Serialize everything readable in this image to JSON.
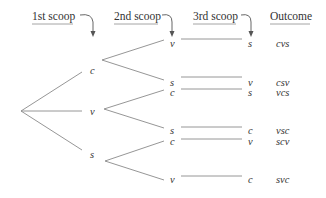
{
  "headers": {
    "first": "1st scoop",
    "second": "2nd scoop",
    "third": "3rd scoop",
    "outcome": "Outcome"
  },
  "level1": [
    {
      "label": "c"
    },
    {
      "label": "v"
    },
    {
      "label": "s"
    }
  ],
  "level2": [
    {
      "label": "v"
    },
    {
      "label": "s"
    },
    {
      "label": "c"
    },
    {
      "label": "s"
    },
    {
      "label": "c"
    },
    {
      "label": "v"
    }
  ],
  "level3": [
    {
      "label": "s"
    },
    {
      "label": "v"
    },
    {
      "label": "s"
    },
    {
      "label": "c"
    },
    {
      "label": "v"
    },
    {
      "label": "c"
    }
  ],
  "outcomes": [
    "cvs",
    "csv",
    "vcs",
    "vsc",
    "scv",
    "svc"
  ]
}
